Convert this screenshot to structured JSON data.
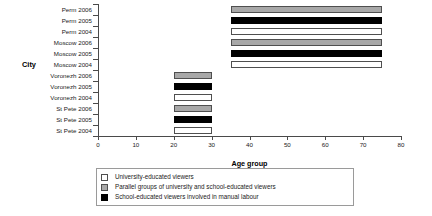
{
  "chart_data": {
    "type": "bar",
    "orientation": "horizontal",
    "subtype": "range-bar",
    "title": "",
    "xlabel": "Age group",
    "ylabel": "City",
    "xlim": [
      0,
      80
    ],
    "ylim": [
      0,
      12
    ],
    "xticks": [
      0,
      10,
      20,
      30,
      40,
      50,
      60,
      70,
      80
    ],
    "xtick_labels": [
      "0",
      "10",
      "20",
      "30",
      "40",
      "50",
      "60",
      "70",
      "80"
    ],
    "grid": false,
    "categories": [
      "Perm 2006",
      "Perm 2005",
      "Perm 2004",
      "Moscow 2006",
      "Moscow 2005",
      "Moscow 2004",
      "Voronezh 2006",
      "Voronezh 2005",
      "Voronezh 2004",
      "St Pete 2006",
      "St Pete 2005",
      "St Pete 2004"
    ],
    "bars": [
      {
        "category": "Perm 2006",
        "start": 35,
        "end": 75,
        "group": "gray"
      },
      {
        "category": "Perm 2005",
        "start": 35,
        "end": 75,
        "group": "black"
      },
      {
        "category": "Perm 2004",
        "start": 35,
        "end": 75,
        "group": "white"
      },
      {
        "category": "Moscow 2006",
        "start": 35,
        "end": 75,
        "group": "gray"
      },
      {
        "category": "Moscow 2005",
        "start": 35,
        "end": 75,
        "group": "black"
      },
      {
        "category": "Moscow 2004",
        "start": 35,
        "end": 75,
        "group": "white"
      },
      {
        "category": "Voronezh 2006",
        "start": 20,
        "end": 30,
        "group": "gray"
      },
      {
        "category": "Voronezh 2005",
        "start": 20,
        "end": 30,
        "group": "black"
      },
      {
        "category": "Voronezh 2004",
        "start": 20,
        "end": 30,
        "group": "white"
      },
      {
        "category": "St Pete 2006",
        "start": 20,
        "end": 30,
        "group": "gray"
      },
      {
        "category": "St Pete 2005",
        "start": 20,
        "end": 30,
        "group": "black"
      },
      {
        "category": "St Pete 2004",
        "start": 20,
        "end": 30,
        "group": "white"
      }
    ],
    "legend_position": "bottom",
    "legend": [
      {
        "swatch": "white",
        "label": "University-educated viewers"
      },
      {
        "swatch": "gray",
        "label": "Parallel groups of university and school-educated viewers"
      },
      {
        "swatch": "black",
        "label": "School-educated viewers involved in manual labour"
      }
    ],
    "colors": {
      "white": "#ffffff",
      "gray": "#a8a8a8",
      "black": "#000000",
      "axis": "#4a4a4a",
      "text": "#1a1a1a",
      "background": "#ffffff"
    }
  }
}
